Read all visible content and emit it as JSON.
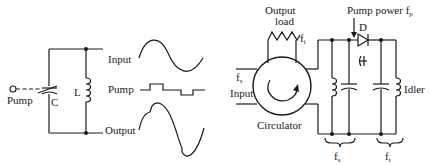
{
  "left_circuit": {
    "pump_label": "Pump",
    "capacitor_label": "C",
    "inductor_label": "L",
    "waveforms": {
      "input_label": "Input",
      "pump_label": "Pump",
      "output_label": "Output"
    }
  },
  "right_circuit": {
    "output_load_line1": "Output",
    "output_load_line2": "load",
    "idler_freq_top": "f",
    "idler_freq_top_sub": "i",
    "input_freq": "f",
    "input_freq_sub": "s",
    "input_label": "Input",
    "circulator_label": "Circulator",
    "pump_power_label": "Pump power f",
    "pump_power_sub": "p",
    "diode_label": "D",
    "idler_label": "Idler",
    "signal_tank_freq": "f",
    "signal_tank_sub": "s",
    "idler_tank_freq": "f",
    "idler_tank_sub": "i"
  }
}
